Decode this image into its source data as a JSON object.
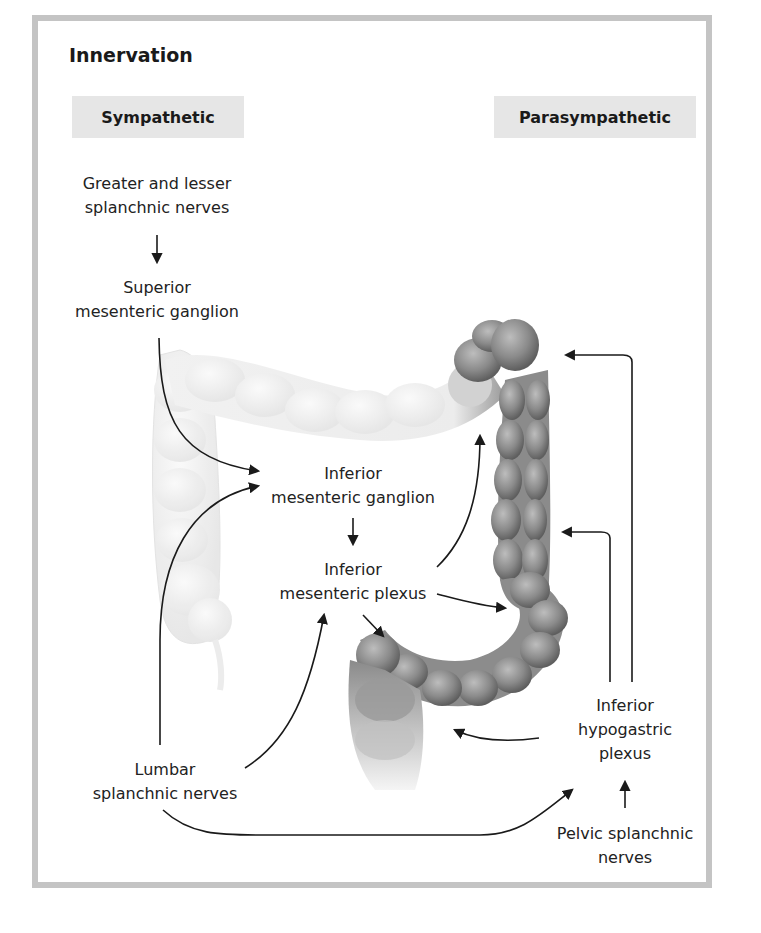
{
  "figure": {
    "title": "Innervation",
    "columns": {
      "sympathetic": "Sympathetic",
      "parasympathetic": "Parasympathetic"
    },
    "labels": {
      "greater_lesser": [
        "Greater and lesser",
        "splanchnic nerves"
      ],
      "superior_mesenteric_ganglion": [
        "Superior",
        "mesenteric ganglion"
      ],
      "inferior_mesenteric_ganglion": [
        "Inferior",
        "mesenteric ganglion"
      ],
      "inferior_mesenteric_plexus": [
        "Inferior",
        "mesenteric plexus"
      ],
      "lumbar_splanchnic": [
        "Lumbar",
        "splanchnic nerves"
      ],
      "inferior_hypogastric_plexus": [
        "Inferior",
        "hypogastric",
        "plexus"
      ],
      "pelvic_splanchnic": [
        "Pelvic splanchnic",
        "nerves"
      ]
    },
    "illustration": {
      "subject": "large-intestine-colon",
      "faded_segments": [
        "ascending colon",
        "transverse colon"
      ],
      "highlighted_segments": [
        "descending colon",
        "sigmoid colon",
        "rectum"
      ]
    },
    "colors": {
      "frame": "#c4c4c4",
      "header_bg": "#e6e6e6",
      "arrow": "#1a1a1a",
      "colon_dark": "#7d7d7d",
      "colon_faded": "#efefef"
    }
  }
}
